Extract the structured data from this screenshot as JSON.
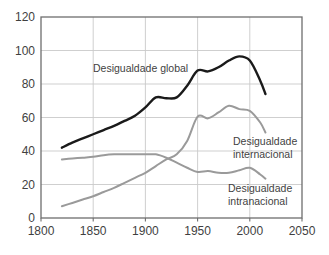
{
  "chart_data": {
    "type": "line",
    "title": "",
    "xlabel": "",
    "ylabel": "",
    "xlim": [
      1800,
      2050
    ],
    "ylim": [
      0,
      120
    ],
    "xticks": [
      1800,
      1850,
      1900,
      1950,
      2000,
      2050
    ],
    "yticks": [
      0,
      20,
      40,
      60,
      80,
      100,
      120
    ],
    "grid": true,
    "legend_position": "inline-annotations",
    "colors": {
      "global": "#1a1a1a",
      "internacional": "#9a9a9a",
      "intranacional": "#9a9a9a",
      "grid": "#c9c9c9",
      "axis": "#6e6e6e",
      "text": "#3f3f3f",
      "background": "#ffffff"
    },
    "series": [
      {
        "name": "Desigualdade global",
        "color": "#1a1a1a",
        "x": [
          1820,
          1830,
          1840,
          1850,
          1860,
          1870,
          1880,
          1890,
          1900,
          1910,
          1920,
          1930,
          1940,
          1950,
          1960,
          1970,
          1980,
          1990,
          2000,
          2010,
          2015
        ],
        "values": [
          42,
          45,
          47.5,
          50,
          52.5,
          55,
          58,
          61,
          66,
          72,
          71.5,
          72,
          79,
          88,
          87.5,
          90,
          94,
          96.5,
          94,
          82,
          74
        ]
      },
      {
        "name": "Desigualdade internacional",
        "color": "#9a9a9a",
        "x": [
          1820,
          1830,
          1840,
          1850,
          1860,
          1870,
          1880,
          1890,
          1900,
          1910,
          1920,
          1930,
          1940,
          1950,
          1960,
          1970,
          1980,
          1990,
          2000,
          2010,
          2015
        ],
        "values": [
          7,
          9,
          11,
          13,
          15.5,
          18,
          21,
          24,
          27,
          31,
          35,
          38,
          46,
          60.5,
          59.5,
          63,
          67,
          65,
          64,
          57,
          51
        ]
      },
      {
        "name": "Desigualdade intranacional",
        "color": "#9a9a9a",
        "x": [
          1820,
          1830,
          1840,
          1850,
          1860,
          1870,
          1880,
          1890,
          1900,
          1910,
          1920,
          1930,
          1940,
          1950,
          1960,
          1970,
          1980,
          1990,
          2000,
          2010,
          2015
        ],
        "values": [
          35,
          35.5,
          36,
          36.5,
          37.5,
          38,
          38,
          38,
          38,
          38,
          36,
          33,
          30,
          27.5,
          28,
          27,
          27,
          28.5,
          30,
          26,
          23.5
        ]
      }
    ],
    "annotations": [
      {
        "id": "global",
        "lines": [
          "Desigualdade global"
        ],
        "x": 93,
        "y": 72
      },
      {
        "id": "internacional",
        "lines": [
          "Desigualdade",
          "internacional"
        ],
        "x": 233,
        "y": 145
      },
      {
        "id": "intranacional",
        "lines": [
          "Desigualdade",
          "intranacional"
        ],
        "x": 228,
        "y": 192
      }
    ]
  }
}
